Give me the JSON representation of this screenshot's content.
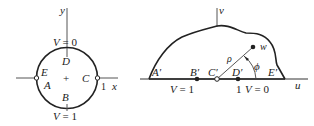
{
  "left_figure": {
    "axis_x": "x",
    "axis_y": "y",
    "top_label": "V = 0",
    "bottom_label": "V = 1",
    "points": {
      "D": "D",
      "E": "E",
      "A": "A",
      "C": "C",
      "B": "B"
    },
    "unit_mark": "1",
    "center_mark": "+"
  },
  "right_figure": {
    "axis_u": "u",
    "axis_v": "v",
    "points": {
      "A": "A′",
      "B": "B′",
      "C": "C′",
      "D": "D′",
      "E": "E′",
      "w": "w"
    },
    "rho": "ρ",
    "phi": "ϕ",
    "label_v1": "V = 1",
    "label_one": "1",
    "label_v0": "V = 0"
  },
  "colors": {
    "stroke": "#222222",
    "background": "#ffffff"
  }
}
